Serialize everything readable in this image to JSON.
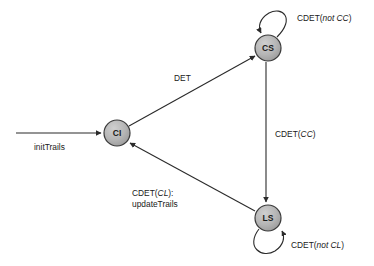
{
  "diagram": {
    "background_color": "#ffffff",
    "node_fill_color": "#b2b2b2",
    "node_stroke_color": "#3a3a3a",
    "edge_color": "#2b2b2b",
    "states": [
      {
        "id": "CI",
        "label": "CI",
        "cx": 117,
        "cy": 133,
        "r": 13
      },
      {
        "id": "CS",
        "label": "CS",
        "cx": 268,
        "cy": 48,
        "r": 13
      },
      {
        "id": "LS",
        "label": "LS",
        "cx": 268,
        "cy": 218,
        "r": 13
      }
    ],
    "entry": {
      "label": "initTrails",
      "target": "CI"
    },
    "transitions": [
      {
        "from": "CI",
        "to": "CS",
        "label": "DET",
        "label_plain": "DET",
        "label_italic": ""
      },
      {
        "from": "CS",
        "to": "LS",
        "label": "CDET(CC)",
        "label_prefix": "CDET(",
        "label_italic": "CC",
        "label_suffix": ")"
      },
      {
        "from": "LS",
        "to": "CI",
        "label_line1_prefix": "CDET(",
        "label_line1_italic": "CL",
        "label_line1_suffix": "):",
        "label_line2": "updateTrails"
      }
    ],
    "self_loops": [
      {
        "state": "CS",
        "label_prefix": "CDET(",
        "label_italic": "not CC",
        "label_suffix": ")"
      },
      {
        "state": "LS",
        "label_prefix": "CDET(",
        "label_italic": "not CL",
        "label_suffix": ")"
      }
    ]
  }
}
